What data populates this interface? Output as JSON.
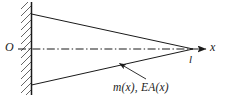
{
  "figure": {
    "type": "engineering-diagram",
    "colors": {
      "line": "#1a1a1a",
      "hatch": "#4a4a4a",
      "background": "#ffffff",
      "centerline": "#1a1a1a"
    },
    "labels": {
      "origin": "O",
      "axis": "x",
      "length": "l",
      "properties": "m(x), EA(x)"
    },
    "geometry": {
      "wall_x": 31,
      "wall_top_y": 2,
      "wall_bottom_y": 95,
      "hatch_width": 10,
      "hatch_angle_deg": 45,
      "rod_top_start_y": 14,
      "rod_bottom_start_y": 85,
      "apex_x": 193,
      "apex_y": 49,
      "axis_arrow_tip_x": 206,
      "axis_start_x": 18,
      "leader_from": [
        146,
        79
      ],
      "leader_to": [
        119,
        63
      ]
    }
  }
}
